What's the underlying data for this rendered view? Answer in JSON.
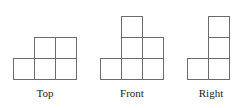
{
  "figure": {
    "background_color": "#ffffff",
    "stroke_color": "#6b6b6b",
    "label_color": "#1a1a1a",
    "cell_size_px": 21,
    "views": [
      {
        "id": "top",
        "label": "Top",
        "cell_count": 5,
        "grid_columns": 3,
        "grid_rows": 2,
        "occupied_cells": [
          {
            "col": 0,
            "row": 1
          },
          {
            "col": 1,
            "row": 1
          },
          {
            "col": 2,
            "row": 1
          },
          {
            "col": 1,
            "row": 0
          },
          {
            "col": 2,
            "row": 0
          }
        ],
        "origin": {
          "x": 13,
          "y": 37
        }
      },
      {
        "id": "front",
        "label": "Front",
        "cell_count": 6,
        "grid_columns": 3,
        "grid_rows": 3,
        "occupied_cells": [
          {
            "col": 0,
            "row": 2
          },
          {
            "col": 1,
            "row": 2
          },
          {
            "col": 2,
            "row": 2
          },
          {
            "col": 1,
            "row": 1
          },
          {
            "col": 2,
            "row": 1
          },
          {
            "col": 1,
            "row": 0
          }
        ],
        "origin": {
          "x": 100,
          "y": 16
        }
      },
      {
        "id": "right",
        "label": "Right",
        "cell_count": 4,
        "grid_columns": 2,
        "grid_rows": 3,
        "occupied_cells": [
          {
            "col": 0,
            "row": 2
          },
          {
            "col": 1,
            "row": 2
          },
          {
            "col": 1,
            "row": 1
          },
          {
            "col": 1,
            "row": 0
          }
        ],
        "origin": {
          "x": 187,
          "y": 16
        }
      }
    ]
  }
}
